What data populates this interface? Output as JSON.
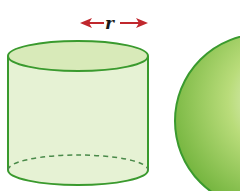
{
  "diagram": {
    "type": "geometry-solids",
    "shapes": [
      {
        "name": "cylinder",
        "fill": "#e3f0cf",
        "stroke": "#3a9a2e"
      },
      {
        "name": "sphere",
        "fill": "#8cc63f",
        "stroke": "#3a9a2e"
      }
    ],
    "radius_label": "r",
    "arrow_color": "#c0272d"
  }
}
